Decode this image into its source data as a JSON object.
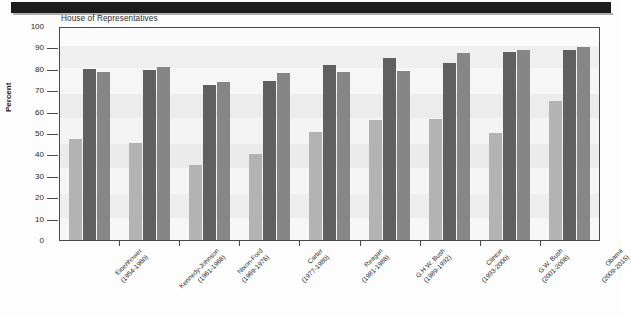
{
  "figure": {
    "y_axis_label": "Percent",
    "colors": {
      "series_light": "#b3b3b3",
      "series_dark": "#606060",
      "series_medium": "#868686",
      "axis": "#4a4a4a",
      "plot_background": "#f3f3f3"
    }
  },
  "chart_data": {
    "type": "bar",
    "title": "House of Representatives",
    "xlabel": "",
    "ylabel": "Percent",
    "ylim": [
      0,
      100
    ],
    "ytick_labels": [
      "100",
      "90",
      "80",
      "70",
      "60",
      "50",
      "40",
      "30",
      "20",
      "10",
      "0"
    ],
    "ytick_values": [
      100,
      90,
      80,
      70,
      60,
      50,
      40,
      30,
      20,
      10,
      0
    ],
    "grid": false,
    "legend": "none",
    "categories": [
      "Eisenhower\n(1954-1960)",
      "Kennedy-Johnson\n(1961-1968)",
      "Nixon-Ford\n(1969-1976)",
      "Carter\n(1977-1980)",
      "Reagan\n(1981-1988)",
      "G.H.W. Bush\n(1989-1992)",
      "Clinton\n(1993-2000)",
      "G.W. Bush\n(2001-2008)",
      "Obama\n(2009-2015)"
    ],
    "category_names": [
      "Eisenhower",
      "Kennedy-Johnson",
      "Nixon-Ford",
      "Carter",
      "Reagan",
      "G.H.W. Bush",
      "Clinton",
      "G.W. Bush",
      "Obama"
    ],
    "category_years": [
      "(1954-1960)",
      "(1961-1968)",
      "(1969-1976)",
      "(1977-1980)",
      "(1981-1988)",
      "(1989-1992)",
      "(1993-2000)",
      "(2001-2008)",
      "(2009-2015)"
    ],
    "series": [
      {
        "name": "series-1",
        "color": "#b3b3b3",
        "values": [
          47,
          45.5,
          35,
          40,
          50.5,
          56,
          56.5,
          50,
          65
        ]
      },
      {
        "name": "series-2",
        "color": "#606060",
        "values": [
          80,
          79.5,
          72.5,
          74.5,
          82,
          85,
          82.5,
          88,
          89
        ]
      },
      {
        "name": "series-3",
        "color": "#868686",
        "values": [
          78.5,
          81,
          74,
          78,
          78.5,
          79,
          87.5,
          89,
          90
        ]
      }
    ]
  }
}
